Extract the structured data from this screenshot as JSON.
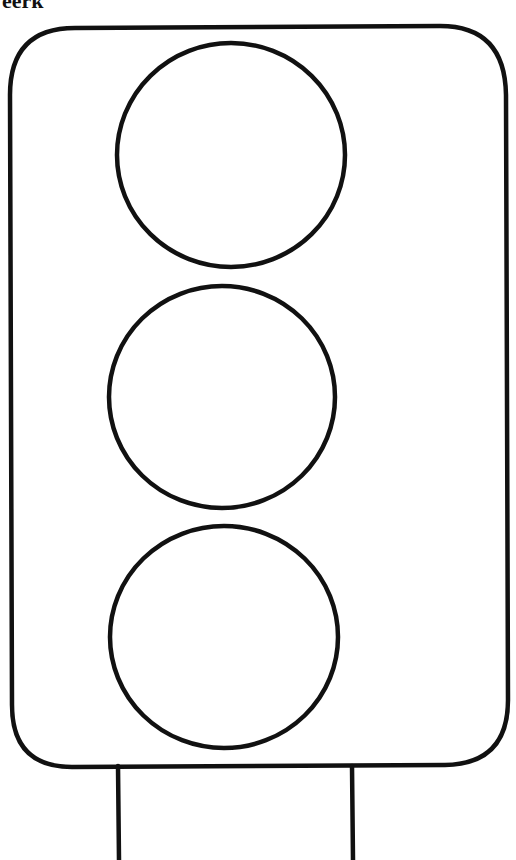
{
  "page": {
    "title_fragment": "eerk"
  },
  "traffic_light": {
    "lights": [
      {
        "position": "top",
        "cx": 231,
        "cy": 155,
        "rx": 114,
        "ry": 112
      },
      {
        "position": "middle",
        "cx": 222,
        "cy": 397,
        "rx": 113,
        "ry": 111
      },
      {
        "position": "bottom",
        "cx": 224,
        "cy": 637,
        "rx": 114,
        "ry": 111
      }
    ],
    "stroke_color": "#111111",
    "fill_color": "#ffffff"
  }
}
